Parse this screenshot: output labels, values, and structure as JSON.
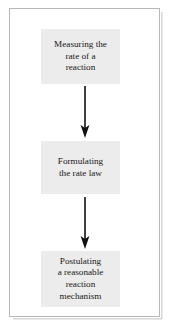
{
  "figure": {
    "type": "flowchart",
    "orientation": "vertical",
    "border_color": "#b8b8b8",
    "background_color": "#ffffff",
    "node_fill_color": "#ececec",
    "text_color": "#171717",
    "arrow_color": "#111111",
    "nodes": [
      {
        "id": "node-1",
        "label": "Measuring the\nrate of a\nreaction",
        "lines": [
          "Measuring the",
          "rate of a",
          "reaction"
        ]
      },
      {
        "id": "node-2",
        "label": "Formulating\nthe rate law",
        "lines": [
          "Formulating",
          "the rate law"
        ]
      },
      {
        "id": "node-3",
        "label": "Postulating\na reasonable\nreaction\nmechanism",
        "lines": [
          "Postulating",
          "a reasonable",
          "reaction",
          "mechanism"
        ]
      }
    ],
    "connectors": [
      {
        "id": "arrow-1",
        "from": "node-1",
        "to": "node-2",
        "direction": "down",
        "style": "solid-arrow"
      },
      {
        "id": "arrow-2",
        "from": "node-2",
        "to": "node-3",
        "direction": "down",
        "style": "solid-arrow"
      }
    ]
  }
}
